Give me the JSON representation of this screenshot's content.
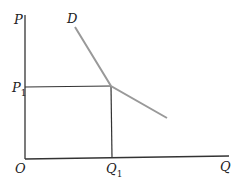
{
  "diagram": {
    "type": "demand-curve",
    "axes": {
      "y_label": "P",
      "x_label": "Q",
      "origin_label": "O"
    },
    "curve_label": "D",
    "price_label": {
      "base": "P",
      "sub": "1"
    },
    "quantity_label": {
      "base": "Q",
      "sub": "1"
    },
    "colors": {
      "axes": "#333333",
      "curve": "#999999",
      "text": "#222222"
    }
  }
}
